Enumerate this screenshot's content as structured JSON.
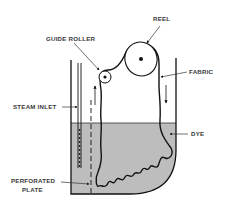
{
  "figure": {
    "type": "schematic",
    "colors": {
      "background": "#ffffff",
      "line": "#111111",
      "dye": "#bdbdbd",
      "label_text": "#3a3a3a"
    }
  },
  "labels": {
    "reel": "REEL",
    "guide_roller": "GUIDE ROLLER",
    "fabric": "FABRIC",
    "steam_inlet": "STEAM INLET",
    "dye": "DYE",
    "perforated_plate_line1": "PERFORATED",
    "perforated_plate_line2": "PLATE"
  }
}
